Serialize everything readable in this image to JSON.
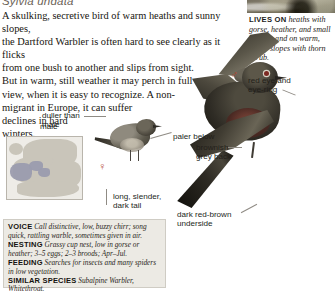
{
  "species": {
    "scientific_name": "Sylvia undata"
  },
  "description": {
    "part1": "A skulking, secretive bird of warm heaths and sunny slopes,",
    "part2": "the Dartford Warbler is often hard to see clearly as it flicks",
    "part3": "from one bush to another and slips from sight.",
    "part4": "But in warm, still weather it may perch in full",
    "part5": "view, when it is easy to recognize. A non-",
    "part6": "migrant in Europe, it can suffer",
    "part7": "declines in hard",
    "part8": "winters."
  },
  "lives_on": {
    "label": "LIVES ON",
    "text": "heaths with gorse, heather, and small bushes, and on warm, bushy slopes with thorn scrub."
  },
  "annotations": {
    "red_eye": "red eye and\neye-ring",
    "duller_than_male": "duller than\nmale",
    "paler_below": "paler below",
    "brownish_grey_back": "brownish\ngrey back",
    "long_slender_dark_tail": "long, slender,\ndark tail",
    "dark_red_brown_underside": "dark red-brown\nunderside",
    "male_caption": "male"
  },
  "symbols": {
    "female": "♀",
    "male": "♂"
  },
  "info_box": {
    "rows": [
      {
        "label": "VOICE",
        "text": "Call distinctive, low, buzzy chirr; song quick, rattling warble, sometimes given in air."
      },
      {
        "label": "NESTING",
        "text": "Grassy cup nest, low in gorse or heather; 3–5 eggs; 2–3 broods; Apr–Jul."
      },
      {
        "label": "FEEDING",
        "text": "Searches for insects and many spiders in low vegetation."
      },
      {
        "label": "SIMILAR SPECIES",
        "text": "Subalpine Warbler, Whitethroat."
      }
    ]
  },
  "colors": {
    "accent_red": "#b3462f",
    "eye_red": "#7d2a22",
    "info_box_bg": "#eceae4",
    "map_range": "#9b9cae",
    "map_land": "#c9c5ba"
  }
}
